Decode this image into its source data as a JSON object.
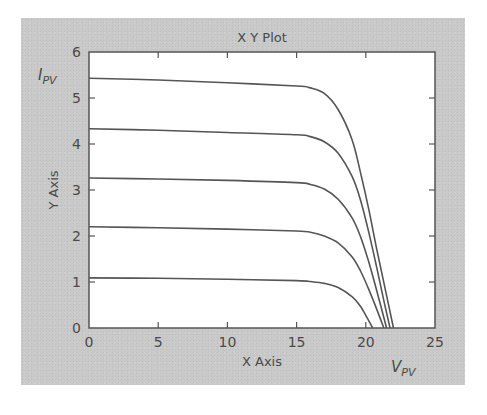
{
  "chart_data": {
    "type": "line",
    "title": "X Y Plot",
    "xlabel": "X Axis",
    "ylabel": "Y Axis",
    "x_var_label": {
      "main": "V",
      "sub": "PV"
    },
    "y_var_label": {
      "main": "I",
      "sub": "PV"
    },
    "xlim": [
      0,
      25
    ],
    "ylim": [
      0,
      6
    ],
    "xticks": [
      0,
      5,
      10,
      15,
      20,
      25
    ],
    "yticks": [
      0,
      1,
      2,
      3,
      4,
      5,
      6
    ],
    "grid": false,
    "legend": null,
    "series": [
      {
        "name": "curve-1",
        "x": [
          0,
          5,
          10,
          15,
          16,
          17,
          18,
          19,
          19.6,
          20.2,
          20.8,
          21.4,
          22.0
        ],
        "y": [
          5.43,
          5.39,
          5.33,
          5.26,
          5.22,
          5.1,
          4.75,
          4.1,
          3.4,
          2.6,
          1.7,
          0.85,
          0
        ]
      },
      {
        "name": "curve-2",
        "x": [
          0,
          5,
          10,
          15,
          16,
          17,
          18,
          19,
          19.6,
          20.2,
          20.8,
          21.3,
          21.75
        ],
        "y": [
          4.33,
          4.3,
          4.25,
          4.2,
          4.16,
          4.05,
          3.8,
          3.3,
          2.8,
          2.1,
          1.3,
          0.6,
          0
        ]
      },
      {
        "name": "curve-3",
        "x": [
          0,
          5,
          10,
          15,
          16,
          17,
          18,
          19,
          19.6,
          20.2,
          20.8,
          21.5
        ],
        "y": [
          3.26,
          3.24,
          3.21,
          3.16,
          3.12,
          3.02,
          2.8,
          2.4,
          2.0,
          1.45,
          0.8,
          0
        ]
      },
      {
        "name": "curve-4",
        "x": [
          0,
          5,
          10,
          15,
          16,
          17,
          18,
          19,
          19.6,
          20.2,
          20.8,
          21.3
        ],
        "y": [
          2.2,
          2.18,
          2.15,
          2.11,
          2.08,
          2.0,
          1.85,
          1.55,
          1.25,
          0.85,
          0.4,
          0
        ]
      },
      {
        "name": "curve-5",
        "x": [
          0,
          5,
          10,
          15,
          16,
          17,
          18,
          19,
          19.6,
          20.1,
          20.5
        ],
        "y": [
          1.09,
          1.08,
          1.06,
          1.03,
          1.01,
          0.97,
          0.88,
          0.68,
          0.48,
          0.22,
          0
        ]
      }
    ],
    "colors": {
      "line": "#555555",
      "panel": "#c9c9c9",
      "plot_bg": "#ffffff",
      "text": "#4a4a4a"
    }
  }
}
